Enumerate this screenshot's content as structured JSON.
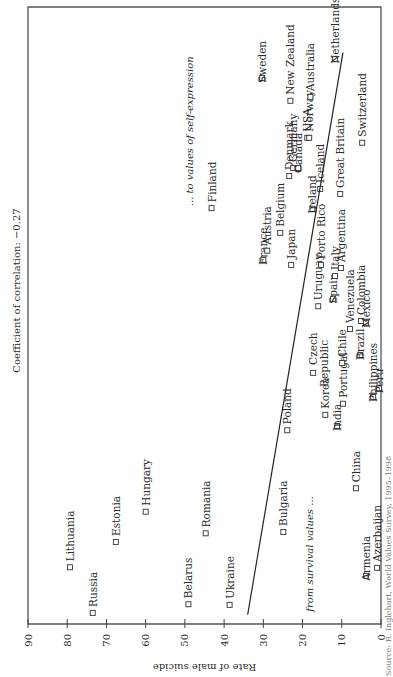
{
  "chart_data": {
    "type": "scatter",
    "orientation": "rotated-90-ccw",
    "title": "",
    "subtitle": "Coefficient of correlation: −0.27",
    "ylabel": "Rate of male suicide",
    "xlabel": "",
    "x_axis_note": "self-expression index (unlabeled, low to high)",
    "annotation_low": "from survival values ...",
    "annotation_high": "... to values of self-expression",
    "ylim": [
      0,
      90
    ],
    "xlim": [
      0,
      100
    ],
    "yticks": [
      90,
      80,
      70,
      60,
      50,
      40,
      30,
      20,
      10,
      0
    ],
    "grid": false,
    "legend": "none",
    "marker": "open-square",
    "trendline": {
      "from": {
        "x": 1.5,
        "y": 34.0
      },
      "to": {
        "x": 92.6,
        "y": 9.7
      }
    },
    "points": [
      {
        "label": "Lithuania",
        "x": 9.2,
        "y": 79.3
      },
      {
        "label": "Russia",
        "x": 1.8,
        "y": 73.5
      },
      {
        "label": "Estonia",
        "x": 13.3,
        "y": 67.6
      },
      {
        "label": "Hungary",
        "x": 18.2,
        "y": 60.0
      },
      {
        "label": "Belarus",
        "x": 3.2,
        "y": 49.1
      },
      {
        "label": "Romania",
        "x": 14.7,
        "y": 44.7
      },
      {
        "label": "Ukraine",
        "x": 3.1,
        "y": 38.6
      },
      {
        "label": "Bulgaria",
        "x": 14.9,
        "y": 24.9
      },
      {
        "label": "China",
        "x": 22.0,
        "y": 6.4
      },
      {
        "label": "Armenia",
        "x": 7.8,
        "y": 3.8
      },
      {
        "label": "Azerbaijan",
        "x": 9.1,
        "y": 1.0
      },
      {
        "label": "India",
        "x": 32.1,
        "y": 11.2
      },
      {
        "label": "Poland",
        "x": 31.4,
        "y": 23.9
      },
      {
        "label": "Korea",
        "x": 33.9,
        "y": 14.2
      },
      {
        "label": "Portugal",
        "x": 35.7,
        "y": 9.7
      },
      {
        "label": "Czech Republic",
        "x": 40.7,
        "y": 17.3
      },
      {
        "label": "Chile",
        "x": 42.3,
        "y": 9.9
      },
      {
        "label": "Philippines",
        "x": 36.8,
        "y": 2.0
      },
      {
        "label": "Peru",
        "x": 38.2,
        "y": 0.5
      },
      {
        "label": "Brazil",
        "x": 43.6,
        "y": 5.3
      },
      {
        "label": "Uruguay",
        "x": 51.5,
        "y": 16.0
      },
      {
        "label": "Spain",
        "x": 52.7,
        "y": 12.2
      },
      {
        "label": "Venezuela",
        "x": 47.8,
        "y": 7.9
      },
      {
        "label": "Colombia",
        "x": 49.1,
        "y": 5.1
      },
      {
        "label": "Mexico",
        "x": 48.8,
        "y": 3.8
      },
      {
        "label": "Italy",
        "x": 56.4,
        "y": 11.7
      },
      {
        "label": "Argentina",
        "x": 57.7,
        "y": 10.2
      },
      {
        "label": "France",
        "x": 59.0,
        "y": 30.0
      },
      {
        "label": "Austria",
        "x": 60.5,
        "y": 29.0
      },
      {
        "label": "Belgium",
        "x": 63.4,
        "y": 25.7
      },
      {
        "label": "Japan",
        "x": 58.2,
        "y": 22.9
      },
      {
        "label": "Ireland",
        "x": 67.3,
        "y": 17.5
      },
      {
        "label": "Porto Rico",
        "x": 58.2,
        "y": 15.3
      },
      {
        "label": "Denmark",
        "x": 72.6,
        "y": 23.4
      },
      {
        "label": "Germany",
        "x": 73.9,
        "y": 22.4
      },
      {
        "label": "Canada",
        "x": 73.9,
        "y": 21.1
      },
      {
        "label": "USA",
        "x": 78.8,
        "y": 18.8
      },
      {
        "label": "Norway",
        "x": 78.8,
        "y": 18.3
      },
      {
        "label": "Iceland",
        "x": 70.5,
        "y": 15.5
      },
      {
        "label": "Great Britain",
        "x": 69.7,
        "y": 10.4
      },
      {
        "label": "Switzerland",
        "x": 78.0,
        "y": 4.8
      },
      {
        "label": "New Zealand",
        "x": 84.8,
        "y": 23.1
      },
      {
        "label": "Australia",
        "x": 85.4,
        "y": 18.0
      },
      {
        "label": "Netherlands",
        "x": 91.6,
        "y": 11.7
      },
      {
        "label": "Sweden",
        "x": 88.5,
        "y": 30.3
      },
      {
        "label": "Finland",
        "x": 67.4,
        "y": 43.2
      }
    ],
    "source_note": "Source: R. Inglehart, World Values Survey, 1995–1998"
  }
}
